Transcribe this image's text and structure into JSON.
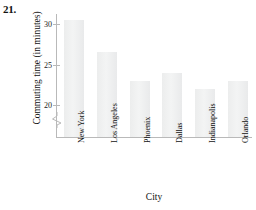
{
  "figure": {
    "problem_number": "21."
  },
  "chart_data": {
    "type": "bar",
    "title": "",
    "xlabel": "City",
    "ylabel": "Commuting time (in minutes)",
    "categories": [
      "New York",
      "Los Angeles",
      "Phoenix",
      "Dallas",
      "Indianapolis",
      "Orlando"
    ],
    "values": [
      30.5,
      26.5,
      23,
      24,
      22,
      23
    ],
    "yticks": [
      20,
      25,
      30
    ],
    "ytick_labels": [
      "20",
      "25",
      "30"
    ],
    "ylim": [
      18,
      32
    ],
    "axis_break": true,
    "grid": false,
    "legend": null,
    "bar_color": "#eeeff0",
    "axis_color": "#b9b9b9"
  }
}
